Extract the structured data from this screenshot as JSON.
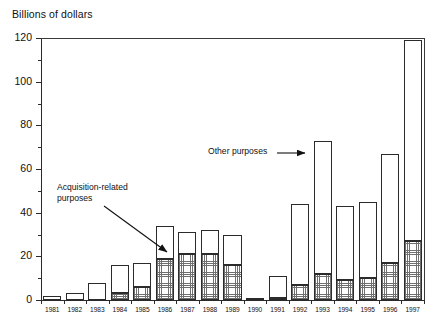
{
  "chart_data": {
    "type": "bar",
    "title": "Billions of dollars",
    "subtitle": "",
    "xlabel": "",
    "ylabel": "Billions of dollars",
    "stacked": true,
    "grid": false,
    "legend_position": "annotations",
    "ylim": [
      0,
      120
    ],
    "yticks": [
      0,
      20,
      40,
      60,
      80,
      100,
      120
    ],
    "yticks_minor": [
      10,
      30,
      50,
      70,
      90,
      110
    ],
    "categories": [
      "1981",
      "1982",
      "1983",
      "1984",
      "1985",
      "1986",
      "1987",
      "1988",
      "1989",
      "1990",
      "1991",
      "1992",
      "1993",
      "1994",
      "1995",
      "1996",
      "1997"
    ],
    "series": [
      {
        "name": "Acquisition-related purposes",
        "values": [
          0,
          0,
          0,
          3,
          6,
          19,
          21,
          21,
          16,
          1,
          1,
          7,
          12,
          9,
          10,
          17,
          27
        ]
      },
      {
        "name": "Other purposes",
        "values": [
          2,
          3,
          8,
          13,
          11,
          15,
          10,
          11,
          14,
          0,
          10,
          37,
          61,
          34,
          35,
          50,
          92
        ]
      }
    ],
    "totals": [
      2,
      3,
      8,
      16,
      17,
      34,
      31,
      32,
      30,
      1,
      11,
      44,
      73,
      43,
      45,
      67,
      119
    ],
    "annotations": [
      {
        "name": "acquisition-related-purposes",
        "text": "Acquisition-related\npurposes"
      },
      {
        "name": "other-purposes",
        "text": "Other purposes"
      }
    ]
  },
  "axis": {
    "y_labels": [
      "120",
      "100",
      "80",
      "60",
      "40",
      "20",
      "0"
    ],
    "x_labels": [
      "1981",
      "1982",
      "1983",
      "1984",
      "1985",
      "1986",
      "1987",
      "1988",
      "1989",
      "1990",
      "1991",
      "1992",
      "1993",
      "1994",
      "1995",
      "1996",
      "1997"
    ]
  },
  "colors": {
    "axis": "#2a2a2a",
    "bar_outline": "#2b2b2b",
    "other_fill": "#ffffff",
    "acquisition_hatch": "#6f6f6f",
    "background": "#ffffff",
    "text": "#111111"
  }
}
